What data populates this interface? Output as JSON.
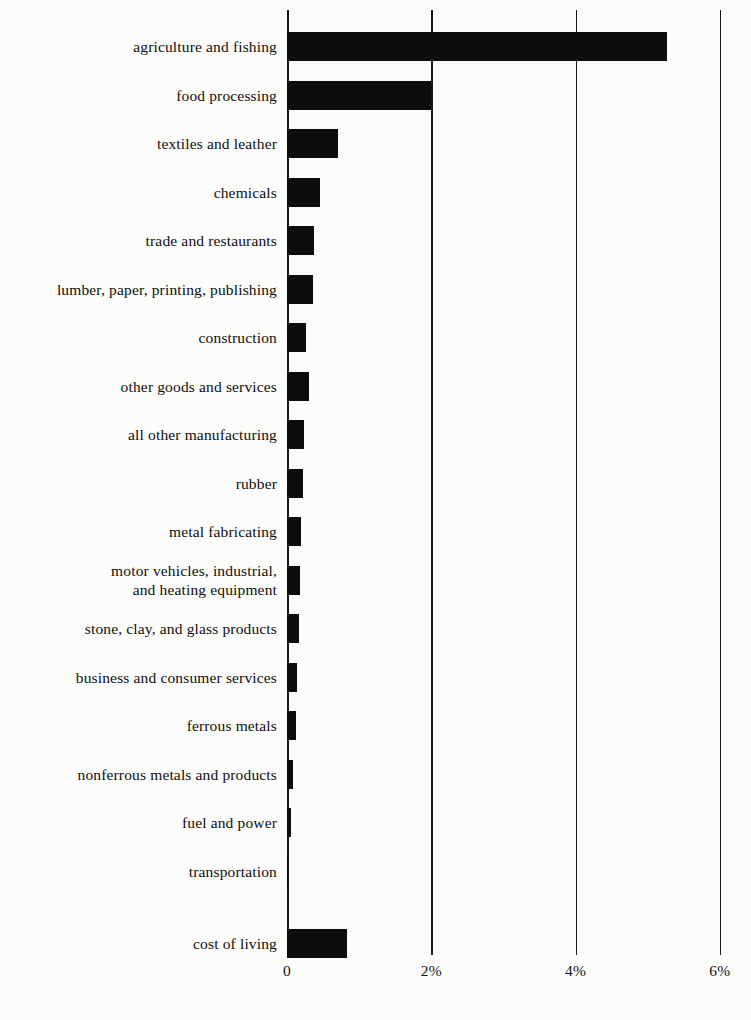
{
  "chart_data": {
    "type": "bar",
    "orientation": "horizontal",
    "title": "",
    "subtitle": "",
    "xlabel": "",
    "ylabel": "",
    "xlim": [
      0,
      6.3
    ],
    "xticks": [
      0,
      2,
      4,
      6
    ],
    "xtick_labels": [
      "0",
      "2%",
      "4%",
      "6%"
    ],
    "grid": "vertical-only",
    "legend": "none",
    "bar_color": "#0d0d0b",
    "axis_color": "#1a1a18",
    "background_color": "#fcfcfa",
    "categories": [
      "agriculture and fishing",
      "food processing",
      "textiles and leather",
      "chemicals",
      "trade and restaurants",
      "lumber, paper, printing, publishing",
      "construction",
      "other goods and services",
      "all other manufacturing",
      "rubber",
      "metal fabricating",
      "motor vehicles, industrial,\nand heating equipment",
      "stone, clay, and glass products",
      "business and consumer services",
      "ferrous metals",
      "nonferrous metals and products",
      "fuel and power",
      "transportation",
      "cost of living"
    ],
    "values": [
      5.27,
      2.0,
      0.71,
      0.46,
      0.38,
      0.36,
      0.27,
      0.3,
      0.24,
      0.22,
      0.2,
      0.18,
      0.16,
      0.14,
      0.12,
      0.09,
      0.06,
      0.02,
      0.83
    ],
    "value_unit": "%"
  },
  "xticks": [
    {
      "label": "0",
      "value": 0
    },
    {
      "label": "2%",
      "value": 2
    },
    {
      "label": "4%",
      "value": 4
    },
    {
      "label": "6%",
      "value": 6
    }
  ]
}
